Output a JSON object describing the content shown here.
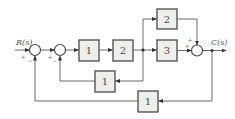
{
  "signals": {
    "input": "R(s)",
    "output": "C(s)"
  },
  "blocks": {
    "forward_1": "1",
    "forward_2": "2",
    "parallel_top": "2",
    "parallel_mid": "3",
    "inner_feedback": "1",
    "outer_feedback": "1"
  },
  "signs": {
    "sum1_input": "+",
    "sum1_feedback": "−",
    "sum2_input": "+",
    "sum2_feedback": "−",
    "sum3_top": "+",
    "sum3_left": "+"
  }
}
